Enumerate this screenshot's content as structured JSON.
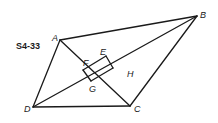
{
  "figure": {
    "id_label": "S4-33"
  },
  "points": {
    "A": {
      "label": "A",
      "x": 60,
      "y": 40
    },
    "B": {
      "label": "B",
      "x": 197,
      "y": 16
    },
    "C": {
      "label": "C",
      "x": 130,
      "y": 106
    },
    "D": {
      "label": "D",
      "x": 33,
      "y": 107
    },
    "E": {
      "label": "E",
      "x": 106,
      "y": 56
    },
    "F": {
      "label": "F"
    },
    "G": {
      "label": "G",
      "x": 91,
      "y": 81
    },
    "H": {
      "label": "H"
    }
  },
  "segments": [
    "AB",
    "BC",
    "CD",
    "DA",
    "AC",
    "DB",
    "FE",
    "EH",
    "FG",
    "GH"
  ]
}
